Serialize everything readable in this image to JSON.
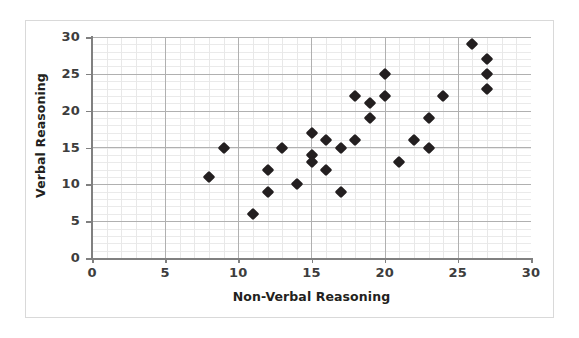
{
  "chart_data": {
    "type": "scatter",
    "title": "",
    "xlabel": "Non-Verbal Reasoning",
    "ylabel": "Verbal Reasoning",
    "xlim": [
      0,
      30
    ],
    "ylim": [
      0,
      30
    ],
    "xticks": [
      "0",
      "5",
      "10",
      "15",
      "20",
      "25",
      "30"
    ],
    "yticks": [
      "0",
      "5",
      "10",
      "15",
      "20",
      "25",
      "30"
    ],
    "grid": true,
    "grid_minor": true,
    "legend": "none",
    "marker": "diamond",
    "marker_color": "#231f20",
    "points": [
      {
        "x": 8,
        "y": 11
      },
      {
        "x": 9,
        "y": 15
      },
      {
        "x": 11,
        "y": 6
      },
      {
        "x": 12,
        "y": 12
      },
      {
        "x": 12,
        "y": 9
      },
      {
        "x": 13,
        "y": 15
      },
      {
        "x": 14,
        "y": 10
      },
      {
        "x": 15,
        "y": 17
      },
      {
        "x": 15,
        "y": 14
      },
      {
        "x": 15,
        "y": 13
      },
      {
        "x": 16,
        "y": 16
      },
      {
        "x": 16,
        "y": 12
      },
      {
        "x": 17,
        "y": 15
      },
      {
        "x": 17,
        "y": 9
      },
      {
        "x": 18,
        "y": 22
      },
      {
        "x": 18,
        "y": 16
      },
      {
        "x": 19,
        "y": 21
      },
      {
        "x": 19,
        "y": 19
      },
      {
        "x": 20,
        "y": 25
      },
      {
        "x": 20,
        "y": 22
      },
      {
        "x": 21,
        "y": 13
      },
      {
        "x": 22,
        "y": 16
      },
      {
        "x": 23,
        "y": 19
      },
      {
        "x": 23,
        "y": 15
      },
      {
        "x": 24,
        "y": 22
      },
      {
        "x": 26,
        "y": 29
      },
      {
        "x": 27,
        "y": 27
      },
      {
        "x": 27,
        "y": 25
      },
      {
        "x": 27,
        "y": 23
      }
    ]
  },
  "colors": {
    "marker": "#231f20",
    "axis": "#808080",
    "grid_major": "#b0b0b0",
    "grid_minor": "#e8e8e8",
    "panel_border": "#d9d9d9",
    "background": "#ffffff",
    "text": "#231f20"
  }
}
